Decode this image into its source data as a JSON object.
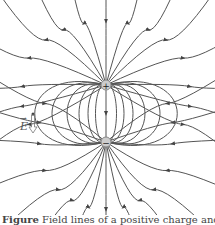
{
  "figure": {
    "background": "#ffffff",
    "line_color": "#555555",
    "charges": [
      {
        "sign": "+",
        "label": "+",
        "x": 106,
        "y": 85
      },
      {
        "sign": "-",
        "label": "−",
        "x": 106,
        "y": 142
      }
    ],
    "vector_label": "E",
    "vector_arrow": "→",
    "field_lines": {
      "outer_angles_deg": [
        -90,
        -75,
        -60,
        -45,
        -25,
        -10,
        8,
        25
      ],
      "loop_widths": [
        14,
        24,
        36,
        52,
        72,
        95
      ]
    }
  },
  "caption": {
    "label": "Figure",
    "text": "Field lines of a positive charge and a negative charge"
  }
}
